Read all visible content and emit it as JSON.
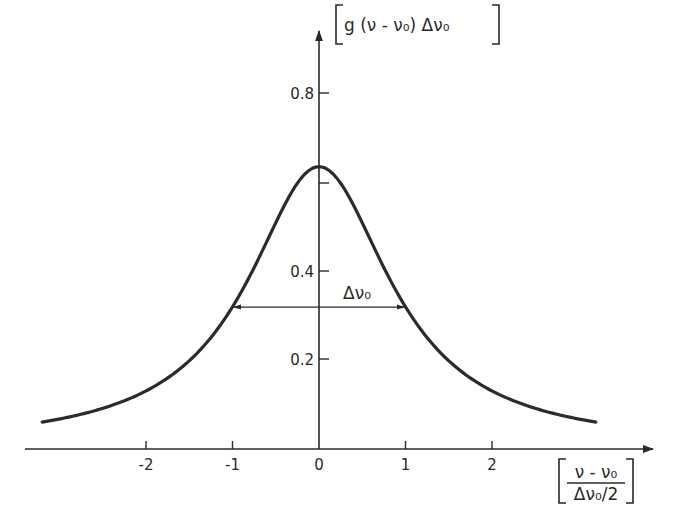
{
  "chart_data": {
    "type": "line",
    "title": "",
    "function": "Lorentzian line profile",
    "xlabel": {
      "numerator": "ν - ν₀",
      "denominator": "Δν₀/2",
      "full": "[(ν - ν₀)/(Δν₀/2)]"
    },
    "ylabel": {
      "text": "g(ν-ν₀)Δν₀",
      "full": "[g(ν-ν₀)Δν₀]"
    },
    "x_ticks": [
      {
        "value": -2,
        "label": "-2"
      },
      {
        "value": -1,
        "label": "-1"
      },
      {
        "value": 0,
        "label": "0"
      },
      {
        "value": 1,
        "label": "1"
      },
      {
        "value": 2,
        "label": "2"
      }
    ],
    "y_ticks": [
      {
        "value": 0.2,
        "label": "0.2"
      },
      {
        "value": 0.4,
        "label": "0.4"
      },
      {
        "value": 0.6,
        "label": ""
      },
      {
        "value": 0.8,
        "label": "0.8"
      }
    ],
    "xlim": [
      -3.2,
      3.9
    ],
    "ylim": [
      0,
      0.95
    ],
    "grid": false,
    "legend": null,
    "series": [
      {
        "name": "g(ν-ν₀)Δν₀",
        "x": [
          -3.2,
          -3.0,
          -2.5,
          -2.0,
          -1.5,
          -1.0,
          -0.75,
          -0.5,
          -0.25,
          0.0,
          0.25,
          0.5,
          0.75,
          1.0,
          1.5,
          2.0,
          2.5,
          3.0,
          3.2
        ],
        "y": [
          0.056,
          0.064,
          0.088,
          0.127,
          0.196,
          0.318,
          0.408,
          0.509,
          0.599,
          0.637,
          0.599,
          0.509,
          0.408,
          0.318,
          0.196,
          0.127,
          0.088,
          0.064,
          0.056
        ]
      }
    ],
    "annotations": [
      {
        "type": "double-arrow",
        "from_x": -1,
        "to_x": 1,
        "y": 0.318,
        "label": "Δν₀",
        "meaning": "full width at half maximum"
      }
    ],
    "peak": {
      "x": 0,
      "y": 0.637
    }
  },
  "labels": {
    "y_axis_title": "g (ν - ν₀) Δν₀",
    "x_axis_num": "ν - ν₀",
    "x_axis_den": "Δν₀/2",
    "fwhm": "Δν₀"
  }
}
